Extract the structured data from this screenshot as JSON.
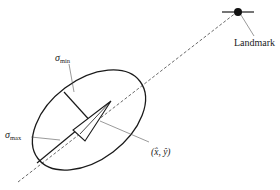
{
  "diagram": {
    "type": "error-ellipse-landmark-observation",
    "colors": {
      "stroke": "#1a1a1a",
      "leader": "#555555",
      "dashed": "#444444",
      "background": "#ffffff"
    },
    "labels": {
      "landmark": "Landmark",
      "sigma_min_symbol": "σ",
      "sigma_min_sub": "min",
      "sigma_max_symbol": "σ",
      "sigma_max_sub": "max",
      "pose": "(x̂, ŷ)"
    },
    "elements": {
      "landmark_marker": "filled-circle-with-horizontal-bar",
      "robot_pose": "triangle",
      "uncertainty": "ellipse",
      "line_of_sight": "dashed-line"
    }
  }
}
